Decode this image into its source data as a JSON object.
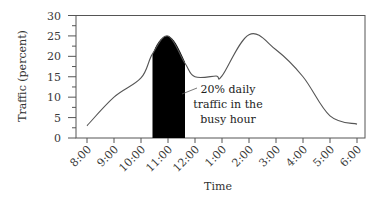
{
  "chart_data": {
    "type": "line",
    "title": "",
    "xlabel": "Time",
    "ylabel": "Traffic (percent)",
    "ylim": [
      0,
      30
    ],
    "yticks": [
      0,
      5,
      10,
      15,
      20,
      25,
      30
    ],
    "categories": [
      "8:00",
      "9:00",
      "10:00",
      "11:00",
      "12:00",
      "1:00",
      "2:00",
      "3:00",
      "4:00",
      "5:00",
      "6:00"
    ],
    "series": [
      {
        "name": "Traffic",
        "values": [
          3,
          10,
          14.7,
          25,
          15,
          15.2,
          25.3,
          21.6,
          15,
          5.4,
          3.4
        ]
      }
    ],
    "shaded_region": {
      "label": "busy hour",
      "x_start": "10:30",
      "x_end": "11:40",
      "peak": 25,
      "color": "#000000"
    },
    "annotation": {
      "lines": [
        "20% daily",
        "traffic in the",
        "busy hour"
      ]
    },
    "grid": false,
    "legend": null
  },
  "colors": {
    "line": "#555555",
    "axis": "#555555",
    "fill": "#000000"
  }
}
